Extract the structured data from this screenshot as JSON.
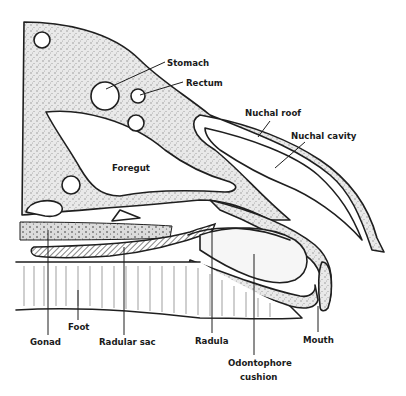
{
  "diagram": {
    "labels": {
      "stomach": "Stomach",
      "rectum": "Rectum",
      "nuchal_roof": "Nuchal roof",
      "nuchal_cavity": "Nuchal cavity",
      "foregut": "Foregut",
      "gonad": "Gonad",
      "foot": "Foot",
      "radular_sac": "Radular sac",
      "radula": "Radula",
      "odontophore_line1": "Odontophore",
      "odontophore_line2": "cushion",
      "mouth": "Mouth"
    },
    "colors": {
      "ink": "#1f1f1f",
      "stipple": "#bdbdbd",
      "background": "#ffffff"
    }
  }
}
